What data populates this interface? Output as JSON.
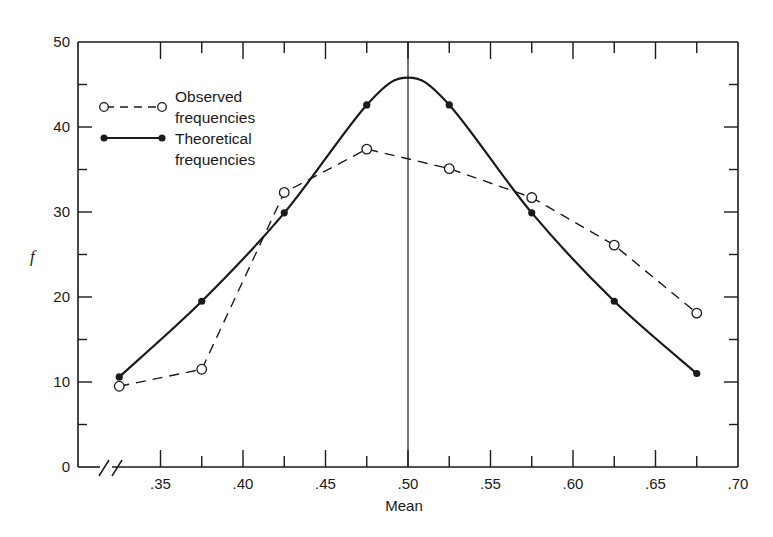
{
  "chart_data": {
    "type": "line",
    "title": "",
    "xlabel": "Mean",
    "ylabel": "f",
    "xlim": [
      0.3,
      0.7
    ],
    "ylim": [
      0,
      50
    ],
    "x_axis_break": true,
    "grid": false,
    "legend_position": "upper-left",
    "x_ticks": [
      ".35",
      ".40",
      ".45",
      ".50",
      ".55",
      ".60",
      ".65",
      ".70"
    ],
    "y_ticks": [
      "0",
      "10",
      "20",
      "30",
      "40",
      "50"
    ],
    "reference_line": {
      "x": 0.5,
      "orientation": "vertical"
    },
    "x": [
      0.325,
      0.375,
      0.425,
      0.475,
      0.525,
      0.575,
      0.625,
      0.675
    ],
    "series": [
      {
        "name": "Observed frequencies",
        "style": "dashed",
        "marker": "open-circle",
        "values": [
          9.5,
          11.5,
          32.3,
          37.4,
          35.1,
          31.7,
          26.1,
          18.1
        ]
      },
      {
        "name": "Theoretical frequencies",
        "style": "solid-smooth",
        "marker": "filled-circle",
        "values": [
          10.6,
          19.5,
          29.9,
          42.6,
          42.6,
          29.9,
          19.5,
          11.0
        ],
        "peak": {
          "x": 0.5,
          "y": 45.8
        }
      }
    ]
  },
  "legend": {
    "observed_line1": "Observed",
    "observed_line2": "frequencies",
    "theoretical_line1": "Theoretical",
    "theoretical_line2": "frequencies"
  },
  "axes": {
    "xlabel": "Mean",
    "ylabel": "f",
    "y_ticks": [
      "0",
      "10",
      "20",
      "30",
      "40",
      "50"
    ],
    "x_ticks": [
      ".35",
      ".40",
      ".45",
      ".50",
      ".55",
      ".60",
      ".65",
      ".70"
    ]
  },
  "colors": {
    "ink": "#1a1a1a",
    "background": "#ffffff"
  }
}
